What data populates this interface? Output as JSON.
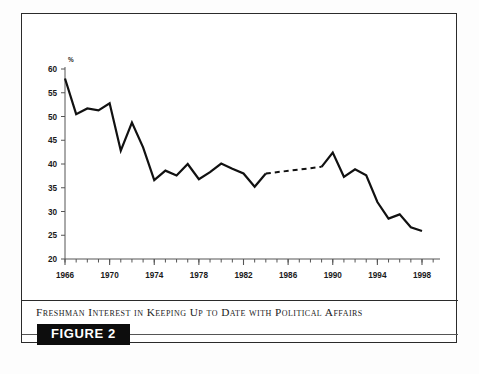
{
  "figure": {
    "caption": "Freshman Interest in Keeping Up to Date with Political Affairs",
    "badge_label": "FIGURE 2"
  },
  "colors": {
    "line": "#111111",
    "axis": "#555555",
    "frame": "#2b2b2b",
    "badge_bg": "#0d0d0d",
    "badge_text": "#ffffff",
    "background": "#ffffff"
  },
  "chart_data": {
    "type": "line",
    "title": "Freshman Interest in Keeping Up to Date with Political Affairs",
    "xlabel": "",
    "ylabel": "%",
    "ylim": [
      20,
      60
    ],
    "xlim": [
      1966,
      1998
    ],
    "ytick_labels": [
      "20",
      "25",
      "30",
      "35",
      "40",
      "45",
      "50",
      "55",
      "60"
    ],
    "yticks": [
      20,
      25,
      30,
      35,
      40,
      45,
      50,
      55,
      60
    ],
    "xtick_labels": [
      "1966",
      "1970",
      "1974",
      "1978",
      "1982",
      "1986",
      "1990",
      "1994",
      "1998"
    ],
    "xticks_major": [
      1966,
      1970,
      1974,
      1978,
      1982,
      1986,
      1990,
      1994,
      1998
    ],
    "xticks_minor_step": 1,
    "grid": false,
    "legend": null,
    "unit_symbol": "%",
    "series": [
      {
        "name": "Freshman interest in keeping up to date with political affairs",
        "style": "solid",
        "x": [
          1966,
          1967,
          1968,
          1969,
          1970,
          1971,
          1972,
          1973,
          1974,
          1975,
          1976,
          1977,
          1978,
          1979,
          1980,
          1981,
          1982,
          1983,
          1984
        ],
        "values": [
          58.0,
          50.5,
          51.7,
          51.3,
          52.8,
          42.8,
          48.7,
          43.5,
          36.6,
          38.6,
          37.6,
          40.0,
          36.8,
          38.3,
          40.1,
          39.0,
          38.0,
          35.2,
          38.0
        ]
      },
      {
        "name": "Interpolated gap (no survey data)",
        "style": "dashed",
        "x": [
          1984,
          1989
        ],
        "values": [
          38.0,
          39.4
        ]
      },
      {
        "name": "Freshman interest in keeping up to date with political affairs (cont.)",
        "style": "solid",
        "x": [
          1989,
          1990,
          1991,
          1992,
          1993,
          1994,
          1995,
          1996,
          1997,
          1998
        ],
        "values": [
          39.4,
          42.4,
          37.3,
          38.9,
          37.6,
          32.0,
          28.5,
          29.4,
          26.7,
          25.9
        ]
      }
    ]
  }
}
